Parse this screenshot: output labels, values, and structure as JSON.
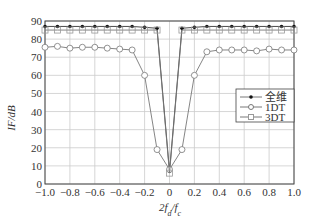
{
  "chart_data": {
    "type": "line",
    "title": "",
    "xlabel": "2f_d/f_c",
    "ylabel": "IF/dB",
    "xlim": [
      -1.0,
      1.0
    ],
    "ylim": [
      0,
      90
    ],
    "xticks": [
      "-1.0",
      "-0.8",
      "-0.6",
      "-0.4",
      "-0.2",
      "0",
      "0.2",
      "0.4",
      "0.6",
      "0.8",
      "1.0"
    ],
    "yticks": [
      "0",
      "10",
      "20",
      "30",
      "40",
      "50",
      "60",
      "70",
      "80",
      "90"
    ],
    "grid": true,
    "legend_position": "right",
    "x": [
      -1.0,
      -0.9,
      -0.8,
      -0.7,
      -0.6,
      -0.5,
      -0.4,
      -0.3,
      -0.2,
      -0.1,
      0,
      0.1,
      0.2,
      0.3,
      0.4,
      0.5,
      0.6,
      0.7,
      0.8,
      0.9,
      1.0
    ],
    "series": [
      {
        "name": "全维",
        "marker": "dot",
        "values": [
          87,
          87,
          87,
          87,
          87,
          87,
          87,
          87,
          86.5,
          86,
          7,
          86,
          86.5,
          87,
          87,
          87,
          87,
          87,
          87,
          87,
          87
        ]
      },
      {
        "name": "1DT",
        "marker": "circle",
        "values": [
          75.5,
          76,
          75,
          75.5,
          75.5,
          75,
          74.5,
          74,
          60,
          19,
          8,
          19,
          60,
          73,
          74,
          74,
          74,
          73.5,
          74.5,
          74,
          74
        ]
      },
      {
        "name": "3DT",
        "marker": "square",
        "values": [
          85,
          85,
          85,
          85,
          85,
          85,
          85,
          85,
          85,
          85,
          6,
          85,
          85,
          85,
          85,
          85,
          85,
          85,
          85,
          85,
          85
        ]
      }
    ]
  }
}
